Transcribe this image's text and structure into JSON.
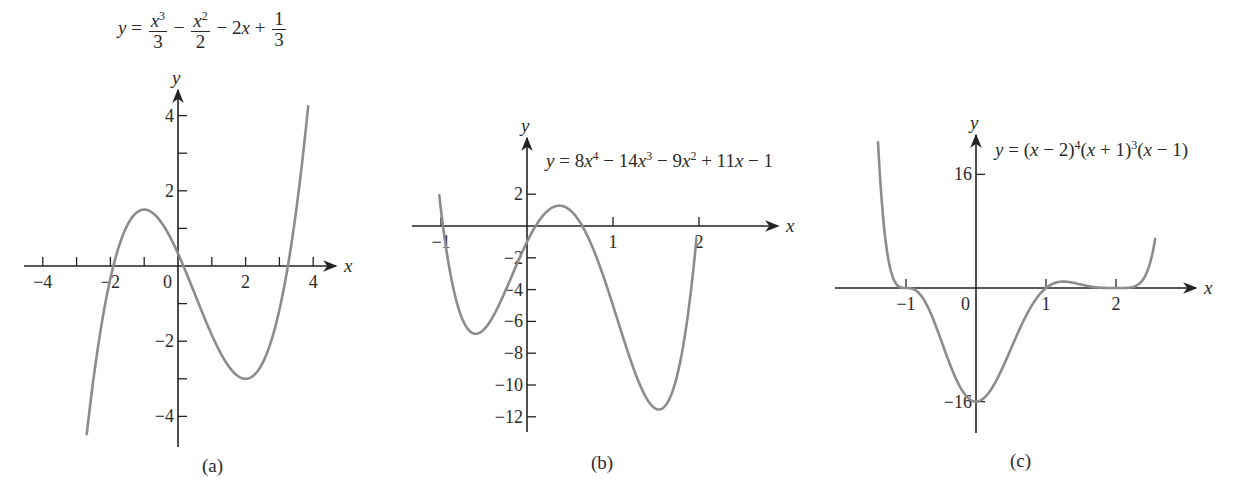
{
  "chart_data": [
    {
      "type": "line",
      "panel": "(a)",
      "title": "y = x^3/3 - x^2/2 - 2x + 1/3",
      "xlabel": "x",
      "ylabel": "y",
      "xlim": [
        -4.3,
        4.6
      ],
      "ylim": [
        -4.8,
        4.6
      ],
      "x_ticks": [
        -4,
        -3,
        -2,
        -1,
        1,
        2,
        3,
        4
      ],
      "x_tick_labels": [
        "-4",
        "-2",
        "0",
        "2",
        "4"
      ],
      "x_tick_label_values": [
        -4,
        -2,
        0,
        2,
        4
      ],
      "y_ticks": [
        -4,
        -3,
        -2,
        -1,
        1,
        2,
        3,
        4
      ],
      "y_tick_labels": [
        "4",
        "2",
        "-2",
        "-4"
      ],
      "y_tick_label_values": [
        4,
        2,
        -2,
        -4
      ],
      "curve_x_range": [
        -2.7,
        3.85
      ],
      "coefficients_desc": [
        0.3333333,
        -0.5,
        -2,
        0.3333333
      ],
      "key_points": {
        "local_max": [
          -1,
          1.5
        ],
        "local_min": [
          2,
          -3
        ],
        "y_intercept": [
          0,
          0.333
        ]
      },
      "series": [
        {
          "name": "y = x^3/3 - x^2/2 - 2x + 1/3",
          "x": [
            -2.7,
            -2,
            -1,
            0,
            1,
            2,
            3,
            3.85
          ],
          "values": [
            -4.47,
            -0.33,
            1.5,
            0.33,
            -1.83,
            -3,
            -1.17,
            4.24
          ]
        }
      ]
    },
    {
      "type": "line",
      "panel": "(b)",
      "title": "y = 8x^4 - 14x^3 - 9x^2 + 11x - 1",
      "xlabel": "x",
      "ylabel": "y",
      "xlim": [
        -1.1,
        2.6
      ],
      "ylim": [
        -13,
        3.5
      ],
      "x_ticks": [
        -1,
        1,
        2
      ],
      "x_tick_labels": [
        "-1",
        "1",
        "2"
      ],
      "x_tick_label_values": [
        -1,
        1,
        2
      ],
      "y_ticks": [
        2,
        -2,
        -4,
        -6,
        -8,
        -10,
        -12
      ],
      "y_tick_labels": [
        "2",
        "-2",
        "-4",
        "-6",
        "-8",
        "-10",
        "-12"
      ],
      "y_tick_label_values": [
        2,
        -2,
        -4,
        -6,
        -8,
        -10,
        -12
      ],
      "curve_x_range": [
        -1.02,
        1.97
      ],
      "coefficients_desc": [
        8,
        -14,
        -9,
        11,
        -1
      ],
      "key_points": {
        "local_min_1": [
          -0.6,
          -6.8
        ],
        "local_max": [
          0.36,
          1.3
        ],
        "local_min_2": [
          1.5,
          -11.3
        ]
      },
      "series": [
        {
          "name": "y = 8x^4 - 14x^3 - 9x^2 + 11x - 1",
          "x": [
            -1,
            -0.6,
            0,
            0.36,
            1,
            1.5,
            1.95
          ],
          "values": [
            -1,
            -6.8,
            -1,
            1.3,
            -5,
            -11.3,
            2.5
          ]
        }
      ]
    },
    {
      "type": "line",
      "panel": "(c)",
      "title": "y = (x - 2)^4 (x + 1)^3 (x - 1)",
      "xlabel": "x",
      "ylabel": "y",
      "xlim": [
        -2,
        3.1
      ],
      "ylim": [
        -22,
        20
      ],
      "x_ticks": [
        -1,
        1,
        2
      ],
      "x_tick_labels": [
        "-1",
        "0",
        "1",
        "2"
      ],
      "x_tick_label_values": [
        -1,
        0,
        1,
        2
      ],
      "y_ticks": [
        16,
        -16
      ],
      "y_tick_labels": [
        "16",
        "-16"
      ],
      "y_tick_label_values": [
        16,
        -16
      ],
      "curve_x_range": [
        -1.4,
        2.56
      ],
      "key_points": {
        "zeros": [
          -1,
          1,
          2
        ],
        "y_intercept": [
          0,
          -16
        ]
      },
      "series": [
        {
          "name": "y = (x - 2)^4 (x + 1)^3 (x - 1)",
          "x": [
            -1.4,
            -1,
            -0.5,
            0,
            0.5,
            1,
            1.3,
            2,
            2.5
          ],
          "values": [
            16.3,
            0,
            -1.2,
            -16,
            -4.7,
            0,
            1.2,
            0,
            12.3
          ]
        }
      ]
    }
  ],
  "equations": {
    "a": {
      "lhs": "y",
      "eq": "=",
      "t1_num": "x",
      "t1_num_sup": "3",
      "t1_den": "3",
      "op1": "−",
      "t2_num": "x",
      "t2_num_sup": "2",
      "t2_den": "2",
      "op2": "−",
      "t3": "2",
      "t3_var": "x",
      "op3": "+",
      "t4_num": "1",
      "t4_den": "3"
    },
    "b": {
      "text_1": "y",
      "text_2": " = 8",
      "v1": "x",
      "s1": "4",
      "text_3": " − 14",
      "v2": "x",
      "s2": "3",
      "text_4": " − 9",
      "v3": "x",
      "s3": "2",
      "text_5": " + 11",
      "v4": "x",
      "text_6": " − 1"
    },
    "c": {
      "text_1": "y",
      "text_2": " = (",
      "v1": "x",
      "text_3": " − 2)",
      "s1": "4",
      "text_4": "(",
      "v2": "x",
      "text_5": " + 1)",
      "s2": "3",
      "text_6": "(",
      "v3": "x",
      "text_7": " − 1)"
    }
  },
  "panel_labels": {
    "a": "(a)",
    "b": "(b)",
    "c": "(c)"
  },
  "colors": {
    "curve": "#8c8c8c",
    "axis": "#222222",
    "text": "#2a2a2a",
    "background": "#ffffff"
  },
  "layout": {
    "a": {
      "ox": 178,
      "oy": 266,
      "sx": 33.8,
      "sy": 37.6,
      "x_axis": [
        24,
        336
      ],
      "y_axis": [
        90,
        447
      ]
    },
    "b": {
      "ox": 527,
      "oy": 226,
      "sx": 86,
      "sy": 15.9,
      "x_axis": [
        412,
        778
      ],
      "y_axis": [
        138,
        432
      ]
    },
    "c": {
      "ox": 976,
      "oy": 288,
      "sx": 70,
      "sy": 7.1,
      "x_axis": [
        835,
        1196
      ],
      "y_axis": [
        135,
        433
      ]
    }
  }
}
